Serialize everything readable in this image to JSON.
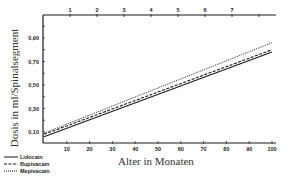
{
  "chart_data": {
    "type": "line",
    "title": "",
    "xlabel": "Alter in Monaten",
    "ylabel": "Dosis in ml/Spinalsegment",
    "xlim": [
      0,
      100
    ],
    "ylim": [
      0.0,
      1.08
    ],
    "x_ticks": [
      10,
      20,
      30,
      40,
      50,
      60,
      70,
      80,
      90,
      100
    ],
    "x_tick_labels": [
      "10",
      "20",
      "30",
      "40",
      "50",
      "60",
      "70",
      "80",
      "90",
      "100"
    ],
    "y_ticks": [
      0.1,
      0.3,
      0.5,
      0.7,
      0.9
    ],
    "y_tick_labels": [
      "0,10",
      "0,30",
      "0,50",
      "0,70",
      "0,90"
    ],
    "top_axis_ticks": [
      1,
      2,
      3,
      4,
      5,
      6,
      7,
      8
    ],
    "top_axis_tick_labels": [
      "1",
      "2",
      "3",
      "4",
      "5",
      "6",
      "7",
      ""
    ],
    "grid": false,
    "legend_position": "bottom-left",
    "x": [
      0,
      100
    ],
    "series": [
      {
        "name": "Lidocain",
        "style": "solid",
        "values": [
          0.06,
          0.78
        ]
      },
      {
        "name": "Bupivacain",
        "style": "dashed",
        "values": [
          0.08,
          0.8
        ]
      },
      {
        "name": "Mepivacain",
        "style": "dotted",
        "values": [
          0.09,
          0.86
        ]
      }
    ]
  },
  "legend": {
    "items": [
      {
        "label": "Lidocain",
        "style": "solid"
      },
      {
        "label": "Bupivacain",
        "style": "dashed"
      },
      {
        "label": "Mepivacain",
        "style": "dotted"
      }
    ]
  }
}
